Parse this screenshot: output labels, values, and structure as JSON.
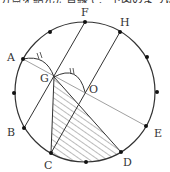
{
  "header": {
    "cropped_text": "分点を結んだ直線で、下図のように"
  },
  "diagram": {
    "circle": {
      "cx": 85,
      "cy": 92,
      "r": 70
    },
    "colors": {
      "stroke": "#333333",
      "hatch": "#555555",
      "thin": "#777777"
    },
    "labels": {
      "A": "A",
      "B": "B",
      "C": "C",
      "D": "D",
      "E": "E",
      "F": "F",
      "G": "G",
      "H": "H",
      "O": "O"
    },
    "points": {
      "F": [
        85,
        22
      ],
      "H": [
        120,
        32
      ],
      "P1": [
        147,
        57
      ],
      "P2": [
        157,
        92
      ],
      "E": [
        146,
        126
      ],
      "D": [
        121,
        152
      ],
      "P3": [
        86,
        162
      ],
      "C": [
        51,
        153
      ],
      "B": [
        24,
        128
      ],
      "P4": [
        14,
        93
      ],
      "A": [
        23,
        59
      ],
      "P5": [
        50,
        32
      ],
      "G": [
        54,
        77
      ],
      "O": [
        85,
        92
      ]
    },
    "segments": [
      {
        "from": "F",
        "to": "B"
      },
      {
        "from": "H",
        "to": "C"
      },
      {
        "from": "G",
        "to": "C"
      },
      {
        "from": "G",
        "to": "D"
      }
    ],
    "thin_segments": [
      {
        "from": "A",
        "to": "E"
      }
    ],
    "arcs": [
      {
        "from": "A",
        "to": "G"
      },
      {
        "from": "G",
        "to": "O"
      }
    ],
    "tick_mark": "//"
  }
}
